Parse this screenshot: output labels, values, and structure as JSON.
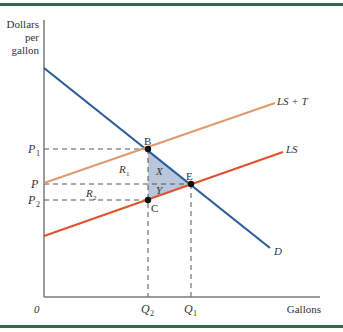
{
  "colors": {
    "border": "#2e6b4a",
    "axis": "#7a7a7a",
    "demand": "#2a5d9a",
    "ls": "#e0512f",
    "ls_plus_t": "#e09a6e",
    "shade": "#b9c6dc",
    "dash": "#555555",
    "point": "#111111"
  },
  "axes": {
    "y_label_line1": "Dollars",
    "y_label_line2": "per",
    "y_label_line3": "gallon",
    "x_label": "Gallons",
    "origin": "0"
  },
  "price_labels": {
    "p1": "P",
    "p1_sub": "1",
    "p": "P",
    "p2": "P",
    "p2_sub": "2"
  },
  "quantity_labels": {
    "q2": "Q",
    "q2_sub": "2",
    "q1": "Q",
    "q1_sub": "1"
  },
  "curves": {
    "demand": "D",
    "ls": "LS",
    "ls_plus_t": "LS + T"
  },
  "points": {
    "b": "B",
    "e": "E",
    "c": "C"
  },
  "regions": {
    "r1": "R",
    "r1_sub": "1",
    "r2": "R",
    "r2_sub": "2",
    "x": "X",
    "y": "Y"
  }
}
